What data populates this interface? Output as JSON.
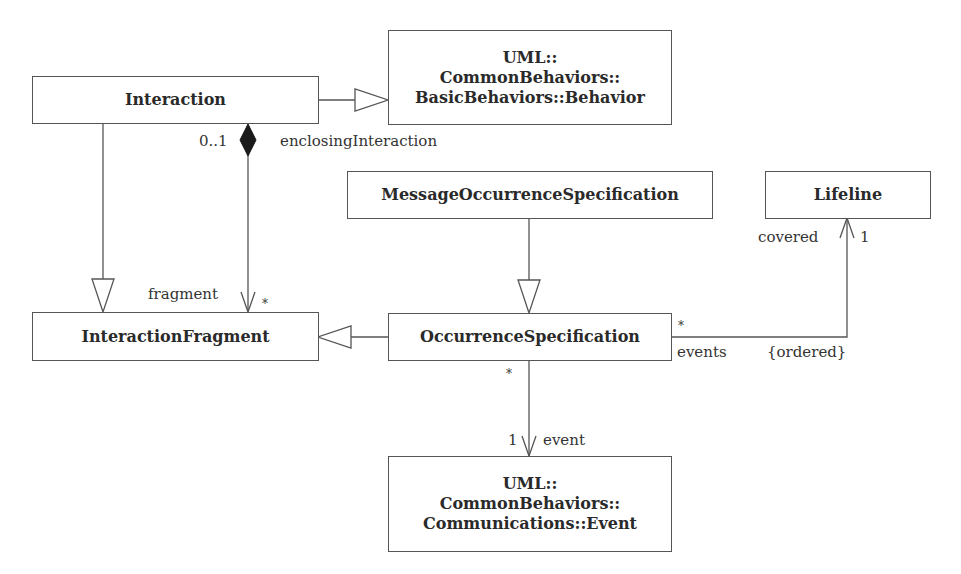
{
  "diagram": {
    "type": "UML class diagram",
    "classes": {
      "interaction": {
        "name": "Interaction"
      },
      "behavior": {
        "lines": [
          "UML::",
          "CommonBehaviors::",
          "BasicBehaviors::Behavior"
        ]
      },
      "message_occurrence_spec": {
        "name": "MessageOccurrenceSpecification"
      },
      "lifeline": {
        "name": "Lifeline"
      },
      "interaction_fragment": {
        "name": "InteractionFragment"
      },
      "occurrence_spec": {
        "name": "OccurrenceSpecification"
      },
      "event": {
        "lines": [
          "UML::",
          "CommonBehaviors::",
          "Communications::Event"
        ]
      }
    },
    "labels": {
      "enclosing_mult": "0..1",
      "enclosing_role": "enclosingInteraction",
      "fragment_role": "fragment",
      "fragment_mult": "*",
      "covered_role": "covered",
      "covered_mult": "1",
      "events_mult": "*",
      "events_role": "events",
      "ordered_constraint": "{ordered}",
      "os_event_mult_source": "*",
      "event_mult": "1",
      "event_role": "event"
    },
    "relationships": [
      {
        "kind": "generalization",
        "from": "Interaction",
        "to": "Behavior"
      },
      {
        "kind": "generalization",
        "from": "Interaction",
        "to": "InteractionFragment"
      },
      {
        "kind": "composition",
        "whole": "Interaction",
        "part": "InteractionFragment",
        "whole_mult": "0..1",
        "part_role": "fragment",
        "part_mult": "*"
      },
      {
        "kind": "generalization",
        "from": "MessageOccurrenceSpecification",
        "to": "OccurrenceSpecification"
      },
      {
        "kind": "generalization",
        "from": "OccurrenceSpecification",
        "to": "InteractionFragment"
      },
      {
        "kind": "association",
        "from": "OccurrenceSpecification",
        "to": "Lifeline",
        "role": "covered",
        "mult": "1",
        "source_role": "events",
        "source_mult": "*",
        "constraint": "{ordered}"
      },
      {
        "kind": "association",
        "from": "OccurrenceSpecification",
        "to": "Event",
        "role": "event",
        "mult": "1",
        "source_mult": "*"
      }
    ]
  }
}
